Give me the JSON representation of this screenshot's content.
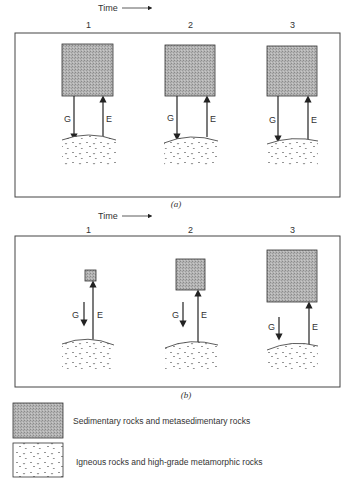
{
  "panels": [
    {
      "id": "a",
      "time_label": "Time",
      "caption": "(a)",
      "stages": [
        {
          "label": "1",
          "g_label": "G",
          "e_label": "E"
        },
        {
          "label": "2",
          "g_label": "G",
          "e_label": "E"
        },
        {
          "label": "3",
          "g_label": "G",
          "e_label": "E"
        }
      ]
    },
    {
      "id": "b",
      "time_label": "Time",
      "caption": "(b)",
      "stages": [
        {
          "label": "1",
          "g_label": "G",
          "e_label": "E"
        },
        {
          "label": "2",
          "g_label": "G",
          "e_label": "E"
        },
        {
          "label": "3",
          "g_label": "G",
          "e_label": "E"
        }
      ]
    }
  ],
  "legend": [
    {
      "pattern": "stippled-gray",
      "label": "Sedimentary rocks and metasedimentary rocks"
    },
    {
      "pattern": "dotted-v",
      "label": "Igneous rocks and high-grade metamorphic rocks"
    }
  ],
  "colors": {
    "sediment_fill": "#a9a9a9",
    "line": "#333333"
  }
}
